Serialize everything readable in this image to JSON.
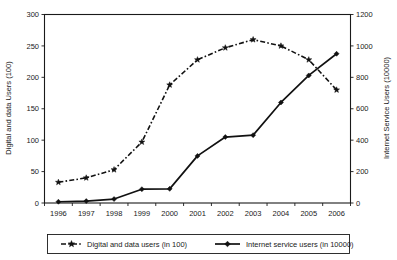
{
  "chart_data": {
    "type": "line",
    "title": "",
    "subtitle": "",
    "xlabel": "",
    "grid": false,
    "legend_position": "bottom",
    "categories": [
      "1996",
      "1997",
      "1998",
      "1999",
      "2000",
      "2001",
      "2002",
      "2003",
      "2004",
      "2005",
      "2006"
    ],
    "axes": {
      "left": {
        "label": "Digital and data Users (100)",
        "ticks": [
          0,
          50,
          100,
          150,
          200,
          250,
          300
        ],
        "tick_labels": [
          "0",
          "50",
          "100",
          "150",
          "200",
          "250",
          "300"
        ],
        "lim": [
          0,
          300
        ]
      },
      "right": {
        "label": "Internet Service Users (10000)",
        "ticks": [
          0,
          200,
          400,
          600,
          800,
          1000,
          1200
        ],
        "tick_labels": [
          "0",
          "200",
          "400",
          "600",
          "800",
          "1000",
          "1200"
        ],
        "lim": [
          0,
          1200
        ]
      }
    },
    "series": [
      {
        "name": "Digital and data users (in 100)",
        "axis": "left",
        "marker": "star",
        "line_style": "dash-dot",
        "color": "#111111",
        "values": [
          33,
          40,
          53,
          97,
          188,
          228,
          247,
          260,
          250,
          228,
          180
        ]
      },
      {
        "name": "Internet service users (in 10000)",
        "axis": "right",
        "marker": "diamond",
        "line_style": "solid",
        "color": "#111111",
        "values": [
          8,
          12,
          25,
          88,
          90,
          300,
          420,
          432,
          640,
          812,
          950
        ]
      }
    ],
    "legend": [
      {
        "label": "Digital and data users (in 100)",
        "marker": "star",
        "line_style": "dash-dot"
      },
      {
        "label": "Internet service users (in 10000)",
        "marker": "diamond",
        "line_style": "solid"
      }
    ]
  }
}
